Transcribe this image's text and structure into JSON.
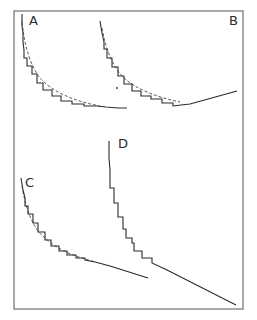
{
  "figure": {
    "panels": [
      {
        "id": "A",
        "label": "A",
        "description": "stepwise curve with dashed smooth hyperbola overlay"
      },
      {
        "id": "B",
        "label": "B",
        "description": "stepwise curve with dashed smooth overlay, rising tail"
      },
      {
        "id": "C",
        "label": "C",
        "description": "stepwise curve with dashed smooth overlay"
      },
      {
        "id": "D",
        "label": "D",
        "description": "stepwise descending curve with long linear tail"
      }
    ],
    "colors": {
      "line": "#2a2a2a",
      "frame": "#7a7a7a",
      "background": "#ffffff"
    }
  }
}
